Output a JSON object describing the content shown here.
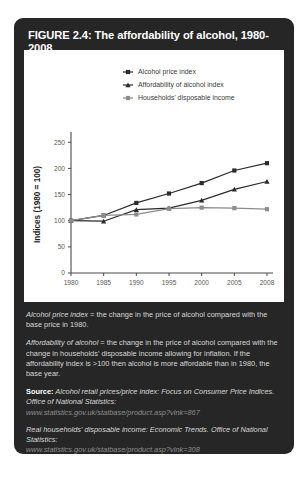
{
  "figure": {
    "title": "FIGURE 2.4: The affordability of alcohol, 1980-2008",
    "card_bg": "#262626",
    "panel_bg": "#ffffff"
  },
  "chart_data": {
    "type": "line",
    "title": "",
    "xlabel": "",
    "ylabel": "Indices (1980 = 100)",
    "x": [
      "1980",
      "1985",
      "1990",
      "1995",
      "2000",
      "2005",
      "2008"
    ],
    "xtick_labels": [
      "1980",
      "1985",
      "1990",
      "1995",
      "2000",
      "2005",
      "2008"
    ],
    "ytick_labels": [
      "0",
      "50",
      "100",
      "150",
      "200",
      "250"
    ],
    "yticks": [
      0,
      50,
      100,
      150,
      200,
      250
    ],
    "ylim": [
      0,
      262
    ],
    "grid": false,
    "legend_position": "top-center",
    "series": [
      {
        "name": "Alcohol price index",
        "color": "#2b2b2b",
        "marker": "square",
        "values": [
          100,
          110,
          134,
          152,
          172,
          196,
          210
        ]
      },
      {
        "name": "Affordability of alcohol index",
        "color": "#2b2b2b",
        "marker": "triangle",
        "values": [
          100,
          99,
          121,
          124,
          139,
          160,
          175
        ]
      },
      {
        "name": "Households' disposable income",
        "color": "#8c8c8c",
        "marker": "square",
        "values": [
          100,
          110,
          112,
          123,
          125,
          124,
          122
        ]
      }
    ]
  },
  "notes": {
    "definition_1_term": "Alcohol price index",
    "definition_1_text": " = the change in the price of alcohol compared with the base price in 1980.",
    "definition_2_term": "Affordability of alcohol",
    "definition_2_text": " = the change in the price of alcohol compared with the change in households' disposable income allowing for inflation. If the affordability index is >100 then alcohol is more affordable than in 1980, the base year.",
    "source_label": "Source:",
    "source_1_text": " Alcohol retail prices/price index: Focus on Consumer Price Indices. Office of National Statistics:",
    "source_1_url": "www.statistics.gov.uk/statbase/product.asp?vlnk=867",
    "source_2_text": "Real households' disposable income: Economic Trends. Office of National Statistics:",
    "source_2_url": "www.statistics.gov.uk/statbase/product.asp?vlnk=308"
  }
}
